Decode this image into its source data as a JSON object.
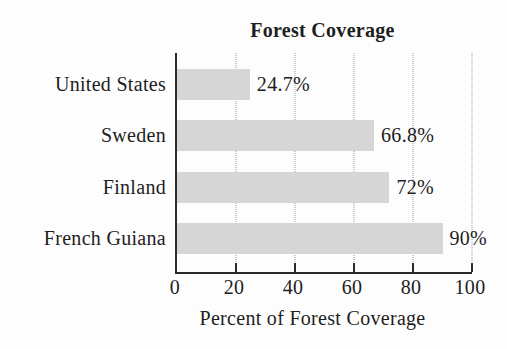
{
  "chart_data": {
    "type": "bar",
    "orientation": "horizontal",
    "title": "Forest Coverage",
    "xlabel": "Percent of Forest Coverage",
    "categories": [
      "United States",
      "Sweden",
      "Finland",
      "French Guiana"
    ],
    "values": [
      24.7,
      66.8,
      72,
      90
    ],
    "value_labels": [
      "24.7%",
      "66.8%",
      "72%",
      "90%"
    ],
    "xticks": [
      0,
      20,
      40,
      60,
      80,
      100
    ],
    "xtick_labels": [
      "0",
      "20",
      "40",
      "60",
      "80",
      "100"
    ],
    "xlim": [
      0,
      100
    ],
    "grid": "vertical-dotted",
    "legend": "none",
    "bar_color": "#d6d6d6",
    "axis_color": "#2b2b2b",
    "gridline_color": "#9b9b9b",
    "text_color": "#1e1e1e",
    "background_color": "#fdfdfd"
  }
}
